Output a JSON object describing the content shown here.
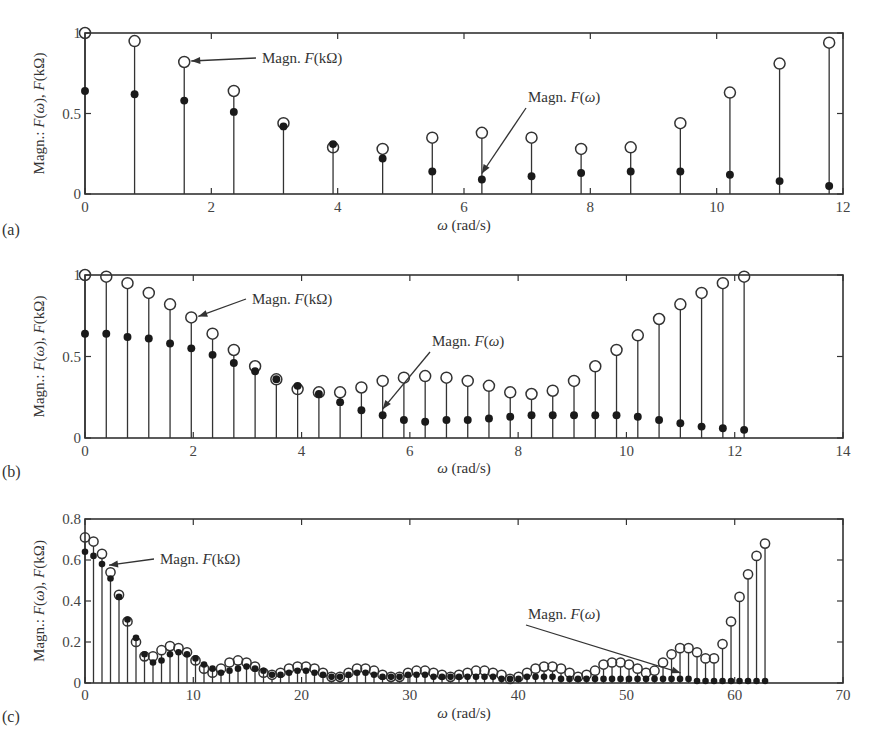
{
  "figure": {
    "panels": [
      "(a)",
      "(b)",
      "(c)"
    ]
  },
  "chart_data": [
    {
      "type": "stem",
      "panel_label": "(a)",
      "title": "",
      "xlabel": "ω (rad/s)",
      "ylabel": "Magn.: F(ω), F(kΩ)",
      "xlim": [
        0,
        12
      ],
      "ylim": [
        0,
        1
      ],
      "xticks": [
        0,
        2,
        4,
        6,
        8,
        10,
        12
      ],
      "yticks": [
        0,
        0.5,
        1
      ],
      "ytick_labels": [
        "0",
        "0.5",
        "1"
      ],
      "grid": false,
      "x": [
        0,
        0.785,
        1.571,
        2.356,
        3.142,
        3.927,
        4.712,
        5.498,
        6.283,
        7.069,
        7.854,
        8.639,
        9.425,
        10.21,
        10.996,
        11.781
      ],
      "series": [
        {
          "name": "Magn. F(kΩ)",
          "marker": "open-circle",
          "values": [
            1.0,
            0.95,
            0.82,
            0.64,
            0.44,
            0.29,
            0.28,
            0.35,
            0.38,
            0.35,
            0.28,
            0.29,
            0.44,
            0.63,
            0.81,
            0.94
          ]
        },
        {
          "name": "Magn. F(ω)",
          "marker": "filled-circle",
          "values": [
            0.64,
            0.62,
            0.58,
            0.51,
            0.42,
            0.31,
            0.22,
            0.14,
            0.09,
            0.11,
            0.13,
            0.14,
            0.14,
            0.12,
            0.08,
            0.05
          ]
        }
      ],
      "annotations": [
        {
          "text": "Magn. F(kΩ)",
          "points_to": [
            1.571,
            0.82
          ]
        },
        {
          "text": "Magn. F(ω)",
          "points_to": [
            6.283,
            0.09
          ]
        }
      ]
    },
    {
      "type": "stem",
      "panel_label": "(b)",
      "title": "",
      "xlabel": "ω (rad/s)",
      "ylabel": "Magn.: F(ω), F(kΩ)",
      "xlim": [
        0,
        14
      ],
      "ylim": [
        0,
        1
      ],
      "xticks": [
        0,
        2,
        4,
        6,
        8,
        10,
        12,
        14
      ],
      "yticks": [
        0,
        0.5,
        1
      ],
      "ytick_labels": [
        "0",
        "0.5",
        "1"
      ],
      "grid": false,
      "x": [
        0,
        0.393,
        0.785,
        1.178,
        1.571,
        1.963,
        2.356,
        2.749,
        3.142,
        3.534,
        3.927,
        4.32,
        4.712,
        5.105,
        5.498,
        5.89,
        6.283,
        6.676,
        7.069,
        7.461,
        7.854,
        8.247,
        8.639,
        9.032,
        9.425,
        9.817,
        10.21,
        10.603,
        10.996,
        11.388,
        11.781,
        12.174
      ],
      "series": [
        {
          "name": "Magn. F(kΩ)",
          "marker": "open-circle",
          "values": [
            1.0,
            0.99,
            0.95,
            0.89,
            0.82,
            0.74,
            0.64,
            0.54,
            0.44,
            0.36,
            0.3,
            0.28,
            0.28,
            0.31,
            0.35,
            0.37,
            0.38,
            0.37,
            0.35,
            0.32,
            0.28,
            0.27,
            0.29,
            0.35,
            0.44,
            0.54,
            0.63,
            0.73,
            0.82,
            0.89,
            0.95,
            0.99
          ]
        },
        {
          "name": "Magn. F(ω)",
          "marker": "filled-circle",
          "values": [
            0.64,
            0.64,
            0.62,
            0.61,
            0.58,
            0.55,
            0.51,
            0.46,
            0.41,
            0.36,
            0.32,
            0.27,
            0.22,
            0.17,
            0.14,
            0.11,
            0.1,
            0.11,
            0.11,
            0.12,
            0.13,
            0.14,
            0.14,
            0.14,
            0.14,
            0.14,
            0.13,
            0.11,
            0.09,
            0.07,
            0.06,
            0.05
          ]
        }
      ],
      "annotations": [
        {
          "text": "Magn. F(kΩ)",
          "points_to": [
            1.963,
            0.74
          ]
        },
        {
          "text": "Magn. F(ω)",
          "points_to": [
            5.498,
            0.14
          ]
        }
      ]
    },
    {
      "type": "stem",
      "panel_label": "(c)",
      "title": "",
      "xlabel": "ω (rad/s)",
      "ylabel": "Magn.: F(ω), F(kΩ)",
      "xlim": [
        0,
        70
      ],
      "ylim": [
        0,
        0.8
      ],
      "xticks": [
        0,
        10,
        20,
        30,
        40,
        50,
        60,
        70
      ],
      "yticks": [
        0,
        0.2,
        0.4,
        0.6,
        0.8
      ],
      "ytick_labels": [
        "0",
        "0.2",
        "0.4",
        "0.6",
        "0.8"
      ],
      "grid": false,
      "x_step": 0.785,
      "num_points": 80,
      "series": [
        {
          "name": "Magn. F(kΩ)",
          "marker": "open-circle",
          "values": [
            0.71,
            0.69,
            0.63,
            0.54,
            0.43,
            0.3,
            0.2,
            0.13,
            0.13,
            0.16,
            0.18,
            0.17,
            0.15,
            0.11,
            0.07,
            0.05,
            0.07,
            0.1,
            0.11,
            0.1,
            0.08,
            0.05,
            0.04,
            0.05,
            0.07,
            0.08,
            0.08,
            0.07,
            0.05,
            0.03,
            0.03,
            0.05,
            0.07,
            0.07,
            0.06,
            0.04,
            0.03,
            0.03,
            0.05,
            0.06,
            0.06,
            0.05,
            0.04,
            0.03,
            0.04,
            0.05,
            0.06,
            0.06,
            0.05,
            0.04,
            0.02,
            0.03,
            0.05,
            0.07,
            0.08,
            0.08,
            0.07,
            0.05,
            0.03,
            0.04,
            0.06,
            0.09,
            0.1,
            0.1,
            0.09,
            0.07,
            0.05,
            0.06,
            0.1,
            0.14,
            0.17,
            0.17,
            0.15,
            0.12,
            0.12,
            0.19,
            0.3,
            0.42,
            0.53,
            0.62,
            0.68
          ]
        },
        {
          "name": "Magn. F(ω)",
          "marker": "filled-circle",
          "values": [
            0.64,
            0.62,
            0.58,
            0.51,
            0.42,
            0.31,
            0.22,
            0.14,
            0.1,
            0.11,
            0.14,
            0.15,
            0.14,
            0.12,
            0.09,
            0.07,
            0.05,
            0.06,
            0.07,
            0.08,
            0.07,
            0.06,
            0.04,
            0.04,
            0.05,
            0.06,
            0.06,
            0.05,
            0.04,
            0.03,
            0.03,
            0.04,
            0.05,
            0.05,
            0.04,
            0.03,
            0.03,
            0.03,
            0.04,
            0.04,
            0.04,
            0.03,
            0.03,
            0.03,
            0.03,
            0.03,
            0.03,
            0.03,
            0.03,
            0.02,
            0.02,
            0.02,
            0.03,
            0.03,
            0.03,
            0.03,
            0.02,
            0.02,
            0.02,
            0.02,
            0.02,
            0.02,
            0.02,
            0.02,
            0.02,
            0.02,
            0.02,
            0.02,
            0.02,
            0.02,
            0.02,
            0.02,
            0.01,
            0.01,
            0.01,
            0.01,
            0.01,
            0.01,
            0.01,
            0.01,
            0.01
          ]
        }
      ],
      "annotations": [
        {
          "text": "Magn. F(kΩ)",
          "points_to": [
            1.571,
            0.57
          ]
        },
        {
          "text": "Magn. F(ω)",
          "points_to": [
            55.0,
            0.02
          ]
        }
      ]
    }
  ]
}
